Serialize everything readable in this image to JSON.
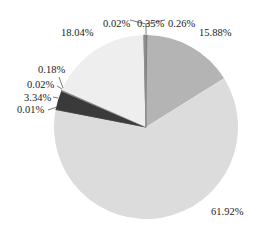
{
  "chart_data": {
    "type": "pie",
    "title": "",
    "start_angle_deg": 0,
    "direction": "clockwise",
    "slices": [
      {
        "label": "0.26%",
        "value": 0.26,
        "color": "#7a7a7a"
      },
      {
        "label": "15.88%",
        "value": 15.88,
        "color": "#b4b4b4"
      },
      {
        "label": "61.92%",
        "value": 61.92,
        "color": "#dcdcdc"
      },
      {
        "label": "0.01%",
        "value": 0.01,
        "color": "#555555"
      },
      {
        "label": "3.34%",
        "value": 3.34,
        "color": "#3a3a3a"
      },
      {
        "label": "0.02%",
        "value": 0.02,
        "color": "#666666"
      },
      {
        "label": "0.18%",
        "value": 0.18,
        "color": "#888888"
      },
      {
        "label": "18.04%",
        "value": 18.04,
        "color": "#eeeeee"
      },
      {
        "label": "0.02%",
        "value": 0.02,
        "color": "#999999"
      },
      {
        "label": "0.35%",
        "value": 0.35,
        "color": "#8c8c8c"
      }
    ],
    "labels": [
      {
        "text": "0.02%",
        "x": 103,
        "y": 27
      },
      {
        "text": "0.35%",
        "x": 137,
        "y": 27
      },
      {
        "text": "0.26%",
        "x": 168,
        "y": 27
      },
      {
        "text": "15.88%",
        "x": 199,
        "y": 36
      },
      {
        "text": "18.04%",
        "x": 61,
        "y": 36
      },
      {
        "text": "0.18%",
        "x": 38,
        "y": 73
      },
      {
        "text": "0.02%",
        "x": 27,
        "y": 88
      },
      {
        "text": "3.34%",
        "x": 24,
        "y": 101
      },
      {
        "text": "0.01%",
        "x": 17,
        "y": 113
      },
      {
        "text": "61.92%",
        "x": 211,
        "y": 215
      }
    ],
    "legend": null
  }
}
